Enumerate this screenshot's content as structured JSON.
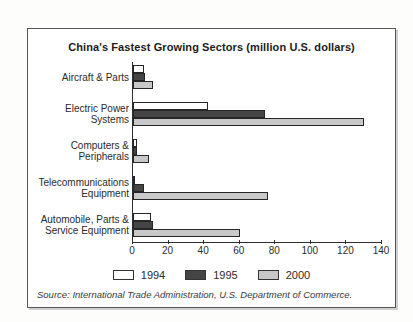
{
  "title": "China's Fastest Growing Sectors (million U.S. dollars)",
  "source": "Source: International Trade Administration, U.S. Department of Commerce.",
  "chart_data": {
    "type": "bar",
    "orientation": "horizontal",
    "title": "China's Fastest Growing Sectors (million U.S. dollars)",
    "categories": [
      "Aircraft & Parts",
      "Electric Power\nSystems",
      "Computers &\nPeripherals",
      "Telecommunications\nEquipment",
      "Automobile, Parts &\nService Equipment"
    ],
    "series": [
      {
        "name": "1994",
        "color": "#ffffff",
        "values": [
          6,
          42,
          2,
          1,
          10
        ]
      },
      {
        "name": "1995",
        "color": "#454545",
        "values": [
          7,
          74,
          2,
          6,
          11
        ]
      },
      {
        "name": "2000",
        "color": "#c8c8c8",
        "values": [
          11,
          130,
          9,
          76,
          60
        ]
      }
    ],
    "xlim": [
      0,
      140
    ],
    "xticks": [
      0,
      20,
      40,
      60,
      80,
      100,
      120,
      140
    ],
    "grid": false,
    "legend_position": "bottom-center"
  }
}
